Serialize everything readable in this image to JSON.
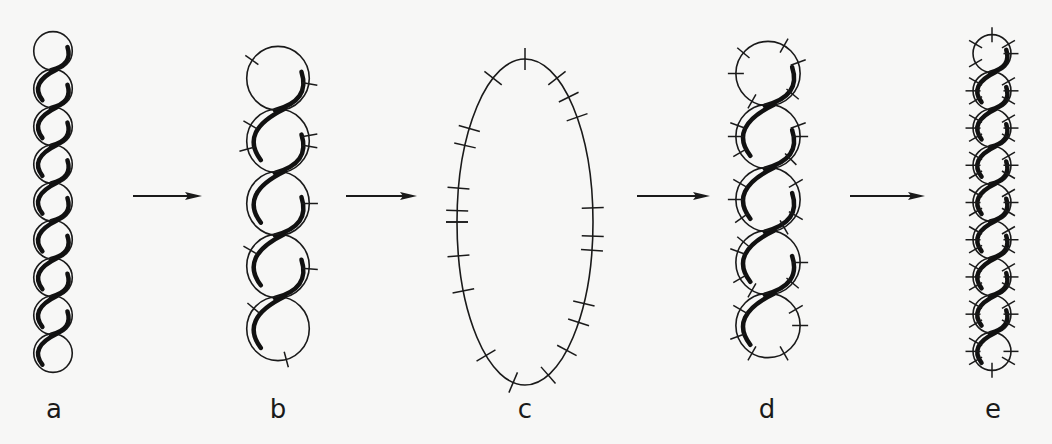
{
  "diagram": {
    "type": "process-sequence",
    "colors": {
      "ink": "#1a1a1a",
      "background": "#f7f7f6"
    },
    "panels": [
      {
        "id": "a",
        "label": "a",
        "cx": 53,
        "top": 32,
        "bottom": 372,
        "count": 9,
        "ticks": 0
      },
      {
        "id": "b",
        "label": "b",
        "cx": 278,
        "top": 47,
        "bottom": 360,
        "count": 5,
        "ticks": 1
      },
      {
        "id": "c",
        "label": "c",
        "cx": 525,
        "cy": 222,
        "rx": 68,
        "ry": 163,
        "shape": "ellipse",
        "ticks": 22
      },
      {
        "id": "d",
        "label": "d",
        "cx": 768,
        "top": 42,
        "bottom": 357,
        "count": 5,
        "ticks": 4
      },
      {
        "id": "e",
        "label": "e",
        "cx": 992,
        "top": 35,
        "bottom": 370,
        "count": 9,
        "ticks": 5
      }
    ],
    "arrows": [
      {
        "from": "a",
        "to": "b",
        "x1": 133,
        "x2": 202,
        "y": 196
      },
      {
        "from": "b",
        "to": "c",
        "x1": 346,
        "x2": 417,
        "y": 196
      },
      {
        "from": "c",
        "to": "d",
        "x1": 637,
        "x2": 710,
        "y": 196
      },
      {
        "from": "d",
        "to": "e",
        "x1": 850,
        "x2": 925,
        "y": 196
      }
    ]
  },
  "labels": {
    "a": "a",
    "b": "b",
    "c": "c",
    "d": "d",
    "e": "e"
  }
}
